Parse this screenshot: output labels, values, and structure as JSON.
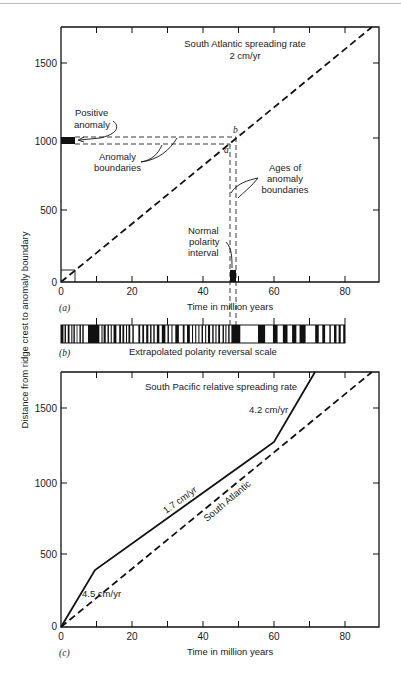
{
  "chart_data": [
    {
      "panel": "a",
      "panel_label": "(a)",
      "type": "line",
      "title": "South Atlantic spreading rate",
      "subtitle": "2 cm/yr",
      "xlabel": "Time in million years",
      "ylabel": "Distance from ridge crest to anomaly boundary",
      "xlim": [
        0,
        90
      ],
      "ylim": [
        0,
        1750
      ],
      "xticks": [
        0,
        10,
        20,
        30,
        40,
        50,
        60,
        70,
        80
      ],
      "xtick_labels": [
        "0",
        "20",
        "40",
        "60",
        "80"
      ],
      "yticks": [
        0,
        500,
        1000,
        1500
      ],
      "ytick_labels": [
        "0",
        "500",
        "1000",
        "1500"
      ],
      "grid": false,
      "series": [
        {
          "name": "South Atlantic (2 cm/yr)",
          "style": "dashed",
          "x": [
            0,
            88
          ],
          "y": [
            0,
            1760
          ]
        }
      ],
      "guide_lines": [
        {
          "name": "anomaly boundary a (horizontal)",
          "y": 960,
          "x": [
            0,
            48
          ]
        },
        {
          "name": "anomaly boundary b (horizontal)",
          "y": 1010,
          "x": [
            0,
            50.5
          ]
        },
        {
          "name": "age boundary a (vertical)",
          "x": 48,
          "y": [
            0,
            960
          ]
        },
        {
          "name": "age boundary b (vertical)",
          "x": 50.5,
          "y": [
            0,
            1010
          ]
        },
        {
          "name": "example box",
          "x": [
            0,
            4
          ],
          "y": [
            0,
            80
          ]
        }
      ],
      "filled_blocks": [
        {
          "name": "positive anomaly",
          "x": [
            0,
            4
          ],
          "y": [
            960,
            1010
          ]
        },
        {
          "name": "normal polarity interval",
          "x": [
            48,
            50.5
          ],
          "y": [
            0,
            80
          ]
        }
      ],
      "annotations": [
        "Positive anomaly",
        "Anomaly boundaries",
        "Ages of anomaly boundaries",
        "Normal polarity interval",
        "a",
        "b"
      ]
    },
    {
      "panel": "b",
      "panel_label": "(b)",
      "type": "table",
      "title": "Extrapolated polarity reversal scale",
      "xlim": [
        0,
        80
      ],
      "description": "Black = normal polarity, white = reversed polarity",
      "normal_intervals_ma": [
        [
          0,
          0.7
        ],
        [
          1.0,
          1.4
        ],
        [
          1.9,
          2.4
        ],
        [
          2.9,
          3.2
        ],
        [
          3.5,
          3.9
        ],
        [
          4.4,
          4.6
        ],
        [
          5.2,
          5.6
        ],
        [
          6.0,
          6.4
        ],
        [
          7.6,
          10.8
        ],
        [
          11.4,
          11.7
        ],
        [
          12.0,
          12.6
        ],
        [
          13.1,
          13.5
        ],
        [
          14.0,
          14.3
        ],
        [
          14.8,
          15.6
        ],
        [
          16.4,
          16.9
        ],
        [
          17.3,
          17.8
        ],
        [
          18.3,
          18.6
        ],
        [
          19.0,
          19.5
        ],
        [
          20.1,
          20.5
        ],
        [
          21.8,
          22.3
        ],
        [
          22.9,
          23.4
        ],
        [
          24.0,
          24.6
        ],
        [
          25.1,
          25.5
        ],
        [
          26.0,
          26.4
        ],
        [
          27.0,
          27.7
        ],
        [
          28.4,
          29.4
        ],
        [
          30.0,
          30.4
        ],
        [
          31.1,
          31.4
        ],
        [
          32.2,
          33.2
        ],
        [
          34.3,
          34.8
        ],
        [
          35.5,
          36.3
        ],
        [
          36.9,
          37.2
        ],
        [
          37.8,
          38.1
        ],
        [
          38.7,
          39.0
        ],
        [
          39.6,
          40.0
        ],
        [
          40.6,
          40.9
        ],
        [
          41.4,
          42.0
        ],
        [
          42.6,
          43.0
        ],
        [
          43.5,
          43.8
        ],
        [
          44.3,
          44.8
        ],
        [
          45.5,
          45.9
        ],
        [
          46.3,
          46.6
        ],
        [
          47.1,
          47.5
        ],
        [
          48.0,
          50.5
        ],
        [
          55.5,
          57.5
        ],
        [
          59.7,
          61.0
        ],
        [
          62.5,
          63.8
        ],
        [
          65.1,
          66.3
        ],
        [
          67.2,
          68.9
        ],
        [
          71.6,
          72.6
        ],
        [
          73.6,
          74.4
        ],
        [
          75.6,
          76.0
        ],
        [
          76.9,
          77.6
        ],
        [
          78.2,
          78.8
        ],
        [
          79.5,
          80.0
        ]
      ]
    },
    {
      "panel": "c",
      "panel_label": "(c)",
      "type": "line",
      "title": "South Pacific relative spreading rate",
      "xlabel": "Time in million years",
      "ylabel": "Distance from ridge crest to anomaly boundary",
      "xlim": [
        0,
        90
      ],
      "ylim": [
        0,
        1750
      ],
      "xticks": [
        0,
        10,
        20,
        30,
        40,
        50,
        60,
        70,
        80
      ],
      "xtick_labels": [
        "0",
        "20",
        "40",
        "60",
        "80"
      ],
      "yticks": [
        0,
        500,
        1000,
        1500
      ],
      "ytick_labels": [
        "0",
        "500",
        "1000",
        "1500"
      ],
      "grid": false,
      "series": [
        {
          "name": "South Pacific",
          "style": "solid",
          "x": [
            0,
            10,
            60,
            72
          ],
          "y": [
            0,
            410,
            1260,
            1760
          ],
          "segment_labels": [
            "4.5 cm/yr",
            "1.7 cm/yr",
            "4.2 cm/yr"
          ]
        },
        {
          "name": "South Atlantic",
          "style": "dashed",
          "x": [
            0,
            88
          ],
          "y": [
            0,
            1760
          ]
        }
      ],
      "annotations": [
        "4.5 cm/yr",
        "1.7 cm/yr",
        "4.2 cm/yr",
        "South Atlantic"
      ]
    }
  ],
  "labels": {
    "a_title": "South Atlantic spreading rate",
    "a_subtitle": "2 cm/yr",
    "positive_1": "Positive",
    "positive_2": "anomaly",
    "boundaries_1": "Anomaly",
    "boundaries_2": "boundaries",
    "ages_1": "Ages of",
    "ages_2": "anomaly",
    "ages_3": "boundaries",
    "normal_1": "Normal",
    "normal_2": "polarity",
    "normal_3": "interval",
    "point_a": "a",
    "point_b": "b",
    "panel_a": "(a)",
    "panel_b": "(b)",
    "panel_c": "(c)",
    "xlabel": "Time in million years",
    "ylabel": "Distance from ridge crest to anomaly boundary",
    "b_title": "Extrapolated polarity reversal scale",
    "c_title": "South Pacific relative spreading rate",
    "rate_45": "4.5 cm/yr",
    "rate_17": "1.7 cm/yr",
    "rate_42": "4.2 cm/yr",
    "south_atlantic": "South Atlantic",
    "x0": "0",
    "x20": "20",
    "x40": "40",
    "x60": "60",
    "x80": "80",
    "y0": "0",
    "y500": "500",
    "y1000": "1000",
    "y1500": "1500"
  }
}
